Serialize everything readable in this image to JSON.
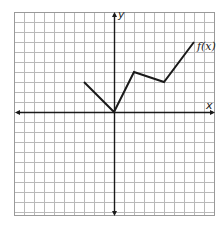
{
  "chart_data": {
    "type": "line",
    "title": "",
    "xlabel": "x",
    "ylabel": "y",
    "xlim": [
      -10,
      10
    ],
    "ylim": [
      -10,
      10
    ],
    "grid": true,
    "grid_step": 1,
    "series": [
      {
        "name": "f(x)",
        "label": "f(x)",
        "points": [
          [
            -3,
            3
          ],
          [
            0,
            0
          ],
          [
            2,
            4
          ],
          [
            5,
            3
          ],
          [
            8,
            7
          ]
        ]
      }
    ],
    "annotations": [
      {
        "text": "f(x)",
        "at": [
          8,
          7
        ]
      }
    ]
  },
  "labels": {
    "x_axis": "x",
    "y_axis": "y",
    "function": "f(x)"
  },
  "colors": {
    "grid": "#b9b9b9",
    "axis": "#1a1a1a",
    "curve": "#1a1a1a"
  }
}
